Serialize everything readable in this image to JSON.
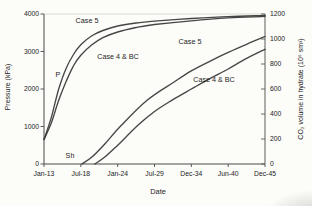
{
  "chart_data": {
    "type": "line",
    "title": "",
    "x_axis": {
      "label": "Date",
      "tick_labels": [
        "Jan-13",
        "Jul-18",
        "Jan-24",
        "Jul-29",
        "Dec-34",
        "Jun-40",
        "Dec-45"
      ],
      "x_encoding": "series x = fractional index into tick_labels (0 = Jan-13, 6 = Dec-45)"
    },
    "y_left": {
      "label": "Pressure (kPa)",
      "range": [
        0,
        4000
      ],
      "ticks": [
        0,
        1000,
        2000,
        3000,
        4000
      ]
    },
    "y_right": {
      "label": "CO₂ volume in hydrate (10⁶ sm³)",
      "range": [
        0,
        1200
      ],
      "ticks": [
        0,
        200,
        400,
        600,
        800,
        1000,
        1200
      ]
    },
    "series": [
      {
        "name": "Pressure Case 5",
        "axis": "left",
        "color": "#383838",
        "x": [
          0,
          0.2,
          0.4,
          0.6,
          0.8,
          1.0,
          1.3,
          1.6,
          2.0,
          2.5,
          3.0,
          4.0,
          5.0,
          6.0
        ],
        "y": [
          650,
          1250,
          2000,
          2550,
          2920,
          3180,
          3420,
          3560,
          3680,
          3760,
          3810,
          3880,
          3930,
          3960
        ]
      },
      {
        "name": "Pressure Case 4 & BC",
        "axis": "left",
        "color": "#383838",
        "x": [
          0,
          0.2,
          0.4,
          0.6,
          0.8,
          1.0,
          1.3,
          1.6,
          2.0,
          2.5,
          3.0,
          4.0,
          5.0,
          6.0
        ],
        "y": [
          650,
          1100,
          1700,
          2200,
          2620,
          2900,
          3180,
          3370,
          3520,
          3640,
          3720,
          3820,
          3895,
          3935
        ]
      },
      {
        "name": "CO2 volume Case 5",
        "axis": "right",
        "color": "#383838",
        "x": [
          1.03,
          1.3,
          1.65,
          2.1,
          2.8,
          3.5,
          4.0,
          4.5,
          5.0,
          5.5,
          6.0
        ],
        "y": [
          0,
          55,
          160,
          310,
          510,
          650,
          745,
          822,
          893,
          958,
          1020
        ]
      },
      {
        "name": "CO2 volume Case 4 & BC",
        "axis": "right",
        "color": "#383838",
        "x": [
          1.38,
          1.65,
          2.0,
          2.55,
          3.0,
          3.5,
          4.0,
          4.5,
          5.0,
          5.5,
          6.0
        ],
        "y": [
          0,
          55,
          150,
          310,
          420,
          515,
          600,
          683,
          760,
          845,
          918
        ]
      }
    ],
    "annotations": [
      {
        "text": "Case 5",
        "x": 87,
        "y": 21,
        "anchor": "middle"
      },
      {
        "text": "Case 4 & BC",
        "x": 118,
        "y": 57,
        "anchor": "middle"
      },
      {
        "text": "P",
        "x": 58,
        "y": 75,
        "anchor": "middle"
      },
      {
        "text": "Case 5",
        "x": 190,
        "y": 42,
        "anchor": "middle"
      },
      {
        "text": "Case 4 & BC",
        "x": 214,
        "y": 80,
        "anchor": "middle"
      },
      {
        "text": "Sh",
        "x": 70,
        "y": 156,
        "anchor": "middle"
      }
    ],
    "layout_hints": {
      "grid": false,
      "legend": "none (curves labeled inline)",
      "dual_y_axes": true
    }
  }
}
